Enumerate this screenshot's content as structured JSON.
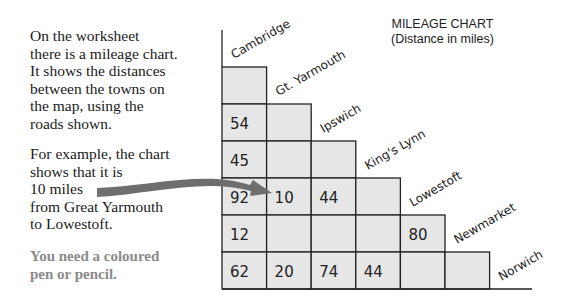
{
  "text": {
    "paragraph1": [
      "On the worksheet",
      "there is a mileage chart.",
      "It shows the distances",
      "between the towns on",
      "the map, using the",
      "roads shown."
    ],
    "paragraph2": [
      "For example, the chart",
      "shows that it is",
      "10 miles",
      "from Great Yarmouth",
      "to Lowestoft."
    ],
    "paragraph3": [
      "You need a coloured",
      "pen or pencil."
    ]
  },
  "chart": {
    "title": "MILEAGE CHART",
    "subtitle": "(Distance in miles)",
    "towns": [
      "Cambridge",
      "Gt. Yarmouth",
      "Ipswich",
      "King's Lynn",
      "Lowestoft",
      "Newmarket",
      "Norwich"
    ],
    "cells": [
      {
        "row": 1,
        "col": 0,
        "value": "54"
      },
      {
        "row": 2,
        "col": 0,
        "value": "45"
      },
      {
        "row": 3,
        "col": 0,
        "value": "92"
      },
      {
        "row": 3,
        "col": 1,
        "value": "10"
      },
      {
        "row": 3,
        "col": 2,
        "value": "44"
      },
      {
        "row": 4,
        "col": 0,
        "value": "12"
      },
      {
        "row": 4,
        "col": 4,
        "value": "80"
      },
      {
        "row": 5,
        "col": 0,
        "value": "62"
      },
      {
        "row": 5,
        "col": 1,
        "value": "20"
      },
      {
        "row": 5,
        "col": 2,
        "value": "74"
      },
      {
        "row": 5,
        "col": 3,
        "value": "44"
      }
    ],
    "colors": {
      "cell_fill": "#e6e6e6",
      "line": "#222222",
      "arrow": "#6e6e6e"
    }
  }
}
